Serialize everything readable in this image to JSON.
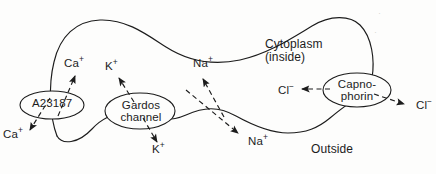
{
  "figure": {
    "style": {
      "background_color": "#fdfdfc",
      "ink_color": "#1c1c1c",
      "stroke_width": 1.1
    }
  },
  "regions": {
    "inside": {
      "label_line1": "Cytoplasm",
      "label_line2": "(inside)"
    },
    "outside": {
      "label": "Outside"
    }
  },
  "carriers": [
    {
      "id": "a23187",
      "name": "A23187",
      "line1": "A23187",
      "line2": "",
      "type": "calcium-ionophore"
    },
    {
      "id": "gardos-channel",
      "name": "Gardos channel",
      "line1": "Gardos",
      "line2": "channel",
      "type": "potassium-channel"
    },
    {
      "id": "capnophorin",
      "name": "Capnophorin",
      "line1": "Capno-",
      "line2": "phorin",
      "type": "anion-exchanger"
    }
  ],
  "ions": {
    "ca_inside": {
      "species": "Ca",
      "charge": "+",
      "label": "Ca"
    },
    "ca_outside": {
      "species": "Ca",
      "charge": "+",
      "label": "Ca"
    },
    "k_inside": {
      "species": "K",
      "charge": "+",
      "label": "K"
    },
    "k_outside": {
      "species": "K",
      "charge": "+",
      "label": "K"
    },
    "na_inside": {
      "species": "Na",
      "charge": "+",
      "label": "Na"
    },
    "na_outside": {
      "species": "Na",
      "charge": "+",
      "label": "Na"
    },
    "cl_inside": {
      "species": "Cl",
      "charge": "−",
      "label": "Cl"
    },
    "cl_outside": {
      "species": "Cl",
      "charge": "−",
      "label": "Cl"
    }
  },
  "arrows": [
    {
      "id": "ca-influx",
      "ion": "Ca",
      "style": "dashed",
      "direction": "outside-to-inside",
      "via": "a23187"
    },
    {
      "id": "ca-efflux",
      "ion": "Ca",
      "style": "dashed",
      "direction": "inside-to-outside",
      "via": "a23187"
    },
    {
      "id": "k-efflux",
      "ion": "K",
      "style": "dashed",
      "direction": "inside-to-outside",
      "via": "gardos-channel"
    },
    {
      "id": "k-influx",
      "ion": "K",
      "style": "dashed",
      "direction": "outside-to-inside",
      "via": "gardos-channel"
    },
    {
      "id": "na-influx",
      "ion": "Na",
      "style": "dashed",
      "direction": "outside-to-inside",
      "via": "leak"
    },
    {
      "id": "na-efflux",
      "ion": "Na",
      "style": "dashed",
      "direction": "inside-to-outside",
      "via": "leak"
    },
    {
      "id": "cl-influx",
      "ion": "Cl",
      "style": "dashed",
      "direction": "outside-to-inside",
      "via": "capnophorin"
    },
    {
      "id": "cl-efflux",
      "ion": "Cl",
      "style": "dashed",
      "direction": "inside-to-outside",
      "via": "capnophorin"
    }
  ],
  "artifacts": {
    "scan_smudge_1": "·",
    "scan_smudge_2": "·"
  }
}
